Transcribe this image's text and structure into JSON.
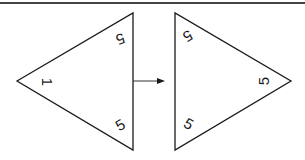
{
  "diagram": {
    "colors": {
      "stroke": "#1a1a1a",
      "top_rule": "#444444",
      "background": "#ffffff"
    },
    "left_triangle": {
      "labels": {
        "left_vertex": "1",
        "top_right": "5",
        "bottom_right": "5"
      }
    },
    "arrow": {
      "direction": "right"
    },
    "right_triangle": {
      "labels": {
        "top_left": "5",
        "right_vertex": "5",
        "bottom_left": "5"
      }
    }
  }
}
